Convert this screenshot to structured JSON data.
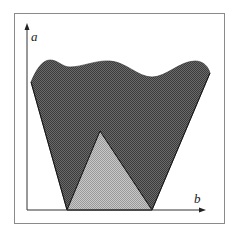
{
  "diagram": {
    "axes": {
      "y_label": "a",
      "x_label": "b"
    },
    "regions": [
      {
        "name": "dark-region",
        "fill": "#5a5a5a",
        "description": "inverted trapezoid with wavy top edge"
      },
      {
        "name": "light-triangle",
        "fill": "#b4b4b4",
        "description": "triangle sitting on the b axis inside dark region"
      }
    ],
    "colors": {
      "frame": "#8a8a8a",
      "axis": "#333333",
      "outline": "#111111"
    }
  }
}
